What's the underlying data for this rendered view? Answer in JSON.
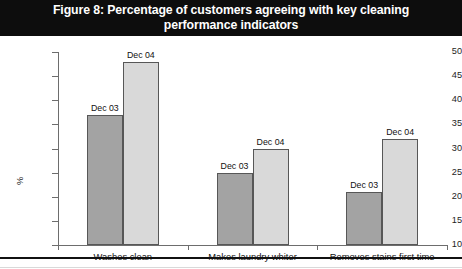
{
  "figure": {
    "title_line1": "Figure 8: Percentage of customers agreeing with key cleaning",
    "title_line2": "performance indicators",
    "title_full": "Figure 8: Percentage of customers agreeing with key cleaning performance indicators"
  },
  "colors": {
    "title_band": "#0d0d0d",
    "title_text": "#ffffff",
    "dec03_bar": "#a3a3a3",
    "dec04_bar": "#d9d9d9",
    "bar_border": "#575757",
    "axis": "#6d6d6d",
    "text": "#111111"
  },
  "chart_data": {
    "type": "bar",
    "title": "Figure 8: Percentage of customers agreeing with key cleaning performance indicators",
    "xlabel": "",
    "ylabel": "%",
    "ylim": [
      10,
      50
    ],
    "yticks": [
      10,
      15,
      20,
      25,
      30,
      35,
      40,
      45,
      50
    ],
    "ytick_labels": [
      "10",
      "15",
      "20",
      "25",
      "30",
      "35",
      "40",
      "45",
      "50"
    ],
    "grid": false,
    "legend_position": "none",
    "data_labels": true,
    "categories": [
      "Washes clean",
      "Makes laundry whiter",
      "Removes stains first time"
    ],
    "series": [
      {
        "name": "Dec 03",
        "color": "#a3a3a3",
        "values": [
          37,
          25,
          21
        ]
      },
      {
        "name": "Dec 04",
        "color": "#d9d9d9",
        "values": [
          48,
          30,
          32
        ]
      }
    ],
    "annotations": [
      {
        "text": "Dec 03",
        "category": "Washes clean",
        "value": 37
      },
      {
        "text": "Dec 04",
        "category": "Washes clean",
        "value": 48
      },
      {
        "text": "Dec 03",
        "category": "Makes laundry whiter",
        "value": 25
      },
      {
        "text": "Dec 04",
        "category": "Makes laundry whiter",
        "value": 30
      },
      {
        "text": "Dec 03",
        "category": "Removes stains first time",
        "value": 21
      },
      {
        "text": "Dec 04",
        "category": "Removes stains first time",
        "value": 32
      }
    ]
  }
}
